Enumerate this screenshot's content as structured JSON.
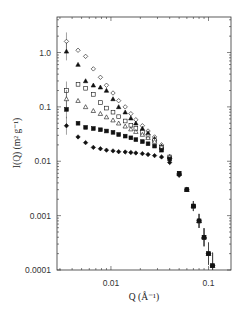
{
  "chart_data": {
    "type": "scatter",
    "title": "",
    "xlabel": "Q (Å⁻¹)",
    "ylabel": "I(Q) (m² g⁻¹)",
    "xscale": "log",
    "yscale": "log",
    "xlim": [
      0.0028,
      0.17
    ],
    "ylim": [
      0.0001,
      4.5
    ],
    "grid": false,
    "legend": null,
    "x_ticks": [
      {
        "value": 0.01,
        "label": "0.01"
      },
      {
        "value": 0.1,
        "label": "0.1"
      }
    ],
    "y_ticks": [
      {
        "value": 1.0,
        "label": "1.0"
      },
      {
        "value": 0.1,
        "label": "0.1"
      },
      {
        "value": 0.01,
        "label": "0.01"
      },
      {
        "value": 0.001,
        "label": "0.001"
      },
      {
        "value": 0.0001,
        "label": "0.0001"
      }
    ],
    "series": [
      {
        "name": "open diamonds",
        "marker": "diamond-open",
        "x": [
          0.0035,
          0.0046,
          0.0055,
          0.0066,
          0.0078,
          0.009,
          0.0105,
          0.012,
          0.014,
          0.016,
          0.018,
          0.021,
          0.024,
          0.028,
          0.033,
          0.04,
          0.05,
          0.06,
          0.07,
          0.08,
          0.09,
          0.1,
          0.11
        ],
        "y": [
          1.6,
          1.1,
          0.85,
          0.5,
          0.35,
          0.25,
          0.18,
          0.13,
          0.1,
          0.075,
          0.058,
          0.045,
          0.036,
          0.028,
          0.02,
          0.012,
          0.006,
          0.003,
          0.0015,
          0.0008,
          0.0004,
          0.0002,
          0.00012
        ]
      },
      {
        "name": "filled triangles",
        "marker": "triangle-filled",
        "x": [
          0.0035,
          0.0046,
          0.0055,
          0.0066,
          0.0078,
          0.009,
          0.0105,
          0.012,
          0.014,
          0.016,
          0.018,
          0.021,
          0.024,
          0.028,
          0.033,
          0.04,
          0.05,
          0.06,
          0.07,
          0.08,
          0.09,
          0.1,
          0.11
        ],
        "y": [
          1.05,
          0.6,
          0.3,
          0.25,
          0.23,
          0.2,
          0.14,
          0.1,
          0.08,
          0.062,
          0.05,
          0.04,
          0.033,
          0.026,
          0.019,
          0.012,
          0.006,
          0.003,
          0.0015,
          0.0008,
          0.0004,
          0.0002,
          0.00012
        ]
      },
      {
        "name": "open squares",
        "marker": "square-open",
        "x": [
          0.0035,
          0.0046,
          0.0055,
          0.0066,
          0.0078,
          0.009,
          0.0105,
          0.012,
          0.014,
          0.016,
          0.018,
          0.021,
          0.024,
          0.028,
          0.033,
          0.04,
          0.05,
          0.06,
          0.07,
          0.08,
          0.09,
          0.1,
          0.11
        ],
        "y": [
          0.2,
          0.26,
          0.22,
          0.17,
          0.12,
          0.095,
          0.08,
          0.066,
          0.055,
          0.046,
          0.04,
          0.034,
          0.029,
          0.024,
          0.018,
          0.012,
          0.006,
          0.003,
          0.0015,
          0.0008,
          0.0004,
          0.0002,
          0.00012
        ]
      },
      {
        "name": "open triangles",
        "marker": "triangle-open",
        "x": [
          0.0035,
          0.0046,
          0.0055,
          0.0066,
          0.0078,
          0.009,
          0.0105,
          0.012,
          0.014,
          0.016,
          0.018,
          0.021,
          0.024,
          0.028,
          0.033,
          0.04,
          0.05,
          0.06,
          0.07,
          0.08,
          0.09,
          0.1,
          0.11
        ],
        "y": [
          0.14,
          0.13,
          0.1,
          0.085,
          0.075,
          0.065,
          0.057,
          0.05,
          0.044,
          0.039,
          0.035,
          0.031,
          0.027,
          0.023,
          0.018,
          0.012,
          0.006,
          0.003,
          0.0015,
          0.0008,
          0.0004,
          0.0002,
          0.00012
        ]
      },
      {
        "name": "filled squares",
        "marker": "square-filled",
        "x": [
          0.0035,
          0.0046,
          0.0055,
          0.0066,
          0.0078,
          0.009,
          0.0105,
          0.012,
          0.014,
          0.016,
          0.018,
          0.021,
          0.024,
          0.028,
          0.033,
          0.04,
          0.05,
          0.06,
          0.07,
          0.08,
          0.09,
          0.1,
          0.11
        ],
        "y": [
          0.09,
          0.05,
          0.042,
          0.04,
          0.038,
          0.036,
          0.034,
          0.031,
          0.029,
          0.027,
          0.025,
          0.023,
          0.021,
          0.019,
          0.016,
          0.011,
          0.006,
          0.003,
          0.0015,
          0.0008,
          0.0004,
          0.0002,
          0.00012
        ]
      },
      {
        "name": "filled diamonds",
        "marker": "diamond-filled",
        "x": [
          0.0035,
          0.0046,
          0.0055,
          0.0066,
          0.0078,
          0.009,
          0.0105,
          0.012,
          0.014,
          0.016,
          0.018,
          0.021,
          0.024,
          0.028,
          0.033,
          0.04,
          0.05,
          0.06,
          0.07,
          0.08,
          0.09,
          0.1,
          0.11
        ],
        "y": [
          0.045,
          0.028,
          0.022,
          0.018,
          0.017,
          0.016,
          0.0155,
          0.015,
          0.0148,
          0.0145,
          0.0142,
          0.0138,
          0.0133,
          0.0127,
          0.012,
          0.0095,
          0.0055,
          0.003,
          0.0015,
          0.0008,
          0.0004,
          0.0002,
          0.00012
        ]
      }
    ]
  }
}
